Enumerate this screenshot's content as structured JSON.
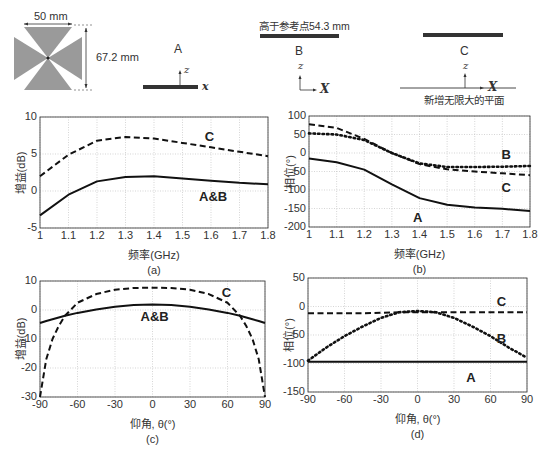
{
  "diagram": {
    "antenna": {
      "width_label": "50 mm",
      "height_label": "67.2 mm"
    },
    "configs": [
      {
        "name": "A",
        "axis_z": "z",
        "axis_x": "x"
      },
      {
        "name": "B",
        "top_label": "高于参考点54.3 mm",
        "axis_z": "z",
        "axis_x": "X"
      },
      {
        "name": "C",
        "axis_z": "z",
        "axis_x": "X",
        "bottom_label": "新增无限大的平面"
      }
    ]
  },
  "chart_data": [
    {
      "id": "a",
      "type": "line",
      "caption": "(a)",
      "xlabel": "频率(GHz)",
      "ylabel": "增益(dB)",
      "xlim": [
        1,
        1.8
      ],
      "ylim": [
        -5,
        10
      ],
      "xticks": [
        "1",
        "1.1",
        "1.2",
        "1.3",
        "1.4",
        "1.5",
        "1.6",
        "1.7",
        "1.8"
      ],
      "yticks": [
        "10",
        "5",
        "0",
        "-5"
      ],
      "grid": true,
      "x": [
        1.0,
        1.1,
        1.2,
        1.3,
        1.4,
        1.5,
        1.6,
        1.7,
        1.8
      ],
      "series": [
        {
          "name": "C",
          "style": "dashed",
          "values": [
            2.0,
            4.9,
            6.8,
            7.3,
            7.1,
            6.5,
            5.9,
            5.3,
            4.7
          ]
        },
        {
          "name": "A&B",
          "style": "solid",
          "values": [
            -3.3,
            -0.5,
            1.3,
            1.9,
            2.0,
            1.7,
            1.4,
            1.1,
            0.9
          ]
        }
      ],
      "annotations": [
        {
          "text": "C",
          "x": 1.62,
          "y": 7.3
        },
        {
          "text": "A&B",
          "x": 1.6,
          "y": -0.8
        }
      ]
    },
    {
      "id": "b",
      "type": "line",
      "caption": "(b)",
      "xlabel": "频率(GHz)",
      "ylabel": "相位(°)",
      "xlim": [
        1,
        1.8
      ],
      "ylim": [
        -200,
        100
      ],
      "xticks": [
        "1",
        "1.1",
        "1.2",
        "1.3",
        "1.4",
        "1.5",
        "1.6",
        "1.7",
        "1.8"
      ],
      "yticks": [
        "100",
        "50",
        "0",
        "-50",
        "-100",
        "-150",
        "-200"
      ],
      "grid": true,
      "x": [
        1.0,
        1.1,
        1.2,
        1.3,
        1.4,
        1.5,
        1.6,
        1.7,
        1.8
      ],
      "series": [
        {
          "name": "A",
          "style": "solid",
          "values": [
            -15,
            -25,
            -45,
            -85,
            -122,
            -140,
            -147,
            -151,
            -157
          ]
        },
        {
          "name": "B",
          "style": "dotted",
          "values": [
            53,
            50,
            35,
            0,
            -28,
            -38,
            -38,
            -37,
            -35
          ]
        },
        {
          "name": "C",
          "style": "dashed",
          "values": [
            78,
            68,
            38,
            0,
            -30,
            -44,
            -50,
            -55,
            -60
          ]
        }
      ],
      "annotations": [
        {
          "text": "B",
          "x": 1.74,
          "y": -5
        },
        {
          "text": "C",
          "x": 1.74,
          "y": -95
        },
        {
          "text": "A",
          "x": 1.42,
          "y": -175
        }
      ]
    },
    {
      "id": "c",
      "type": "line",
      "caption": "(c)",
      "xlabel": "仰角, θ(°)",
      "ylabel": "增益(dB)",
      "xlim": [
        -90,
        90
      ],
      "ylim": [
        -30,
        10
      ],
      "xticks": [
        "-90",
        "-60",
        "-30",
        "0",
        "30",
        "60",
        "90"
      ],
      "yticks": [
        "10",
        "0",
        "-10",
        "-20",
        "-30"
      ],
      "grid": true,
      "x": [
        -90,
        -85,
        -80,
        -75,
        -70,
        -60,
        -45,
        -30,
        -15,
        0,
        15,
        30,
        45,
        60,
        70,
        75,
        80,
        85,
        90
      ],
      "series": [
        {
          "name": "C",
          "style": "dashed",
          "values": [
            -30,
            -17,
            -10,
            -5.5,
            -2,
            2.5,
            5.5,
            7,
            7.6,
            7.7,
            7.6,
            7,
            5.5,
            2.5,
            -2,
            -5.5,
            -10,
            -17,
            -30
          ]
        },
        {
          "name": "A&B",
          "style": "solid",
          "values": [
            -4.5,
            -3.8,
            -3.2,
            -2.6,
            -2,
            -1,
            0.2,
            1.1,
            1.7,
            1.9,
            1.7,
            1.1,
            0.2,
            -1,
            -2,
            -2.6,
            -3.2,
            -3.8,
            -4.5
          ]
        }
      ],
      "annotations": [
        {
          "text": "C",
          "x": 65,
          "y": 6
        },
        {
          "text": "A&B",
          "x": 0,
          "y": -2.5
        }
      ]
    },
    {
      "id": "d",
      "type": "line",
      "caption": "(d)",
      "xlabel": "仰角, θ(°)",
      "ylabel": "相位(°)",
      "xlim": [
        -90,
        90
      ],
      "ylim": [
        -150,
        50
      ],
      "xticks": [
        "-90",
        "-60",
        "-30",
        "0",
        "30",
        "60",
        "90"
      ],
      "yticks": [
        "50",
        "0",
        "-50",
        "-100",
        "-150"
      ],
      "grid": true,
      "x": [
        -90,
        -75,
        -60,
        -45,
        -30,
        -15,
        0,
        15,
        30,
        45,
        60,
        75,
        90
      ],
      "series": [
        {
          "name": "A",
          "style": "solid",
          "values": [
            -97,
            -97,
            -97,
            -97,
            -97,
            -97,
            -97,
            -97,
            -97,
            -97,
            -97,
            -97,
            -97
          ]
        },
        {
          "name": "B",
          "style": "dotted",
          "values": [
            -95,
            -72,
            -52,
            -35,
            -20,
            -10,
            -8,
            -10,
            -20,
            -35,
            -52,
            -72,
            -90
          ]
        },
        {
          "name": "C",
          "style": "dashed",
          "values": [
            -12,
            -12,
            -12,
            -12,
            -11,
            -10,
            -10,
            -10,
            -10,
            -10,
            -10,
            -10,
            -10
          ]
        }
      ],
      "annotations": [
        {
          "text": "C",
          "x": 75,
          "y": 8
        },
        {
          "text": "B",
          "x": 75,
          "y": -57
        },
        {
          "text": "A",
          "x": 50,
          "y": -125
        }
      ]
    }
  ]
}
